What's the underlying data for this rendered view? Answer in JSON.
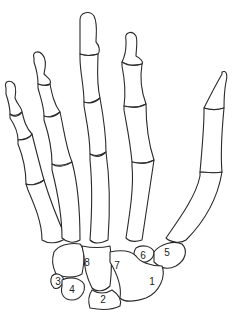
{
  "diagram": {
    "stroke_color": "#2a2a2a",
    "background": "#ffffff",
    "carpal_labels": [
      {
        "id": "1",
        "text": "1",
        "x": 152,
        "y": 281
      },
      {
        "id": "2",
        "text": "2",
        "x": 103,
        "y": 299
      },
      {
        "id": "3",
        "text": "3",
        "x": 58,
        "y": 281
      },
      {
        "id": "4",
        "text": "4",
        "x": 72,
        "y": 289
      },
      {
        "id": "5",
        "text": "5",
        "x": 167,
        "y": 252
      },
      {
        "id": "6",
        "text": "6",
        "x": 143,
        "y": 255
      },
      {
        "id": "7",
        "text": "7",
        "x": 117,
        "y": 265
      },
      {
        "id": "8",
        "text": "8",
        "x": 87,
        "y": 262
      }
    ]
  }
}
